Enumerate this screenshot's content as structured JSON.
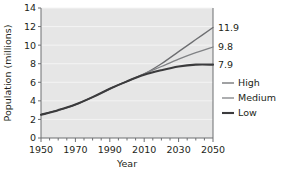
{
  "chart_data": {
    "type": "line",
    "title": "",
    "xlabel": "Year",
    "ylabel": "Population (millions)",
    "xlim": [
      1950,
      2050
    ],
    "ylim": [
      0,
      14
    ],
    "grid": true,
    "grid_orientation": "horizontal",
    "plot_background": "#e6e6e6",
    "figure_background": "#ffffff",
    "legend_position": "right",
    "x_major_ticks": [
      1950,
      1970,
      1990,
      2010,
      2030,
      2050
    ],
    "x_major_tick_labels": [
      "1950",
      "1970",
      "1990",
      "2010",
      "2030",
      "2050"
    ],
    "x_minor_tick_step": 5,
    "y_ticks": [
      0,
      2,
      4,
      6,
      8,
      10,
      12,
      14
    ],
    "y_tick_labels": [
      "0",
      "2",
      "4",
      "6",
      "8",
      "10",
      "12",
      "14"
    ],
    "x": [
      1950,
      1960,
      1970,
      1980,
      1990,
      2000,
      2010,
      2020,
      2030,
      2040,
      2050
    ],
    "series": [
      {
        "name": "High",
        "color": "#6d6e71",
        "width": 1.3,
        "end_label": "11.9",
        "end_value": 11.9,
        "values": [
          2.5,
          3.0,
          3.6,
          4.4,
          5.3,
          6.1,
          6.9,
          8.0,
          9.3,
          10.6,
          11.9
        ]
      },
      {
        "name": "Medium",
        "color": "#808285",
        "width": 1.3,
        "end_label": "9.8",
        "end_value": 9.8,
        "values": [
          2.5,
          3.0,
          3.6,
          4.4,
          5.3,
          6.1,
          6.9,
          7.7,
          8.5,
          9.2,
          9.8
        ]
      },
      {
        "name": "Low",
        "color": "#3b3b3d",
        "width": 2.1,
        "end_label": "7.9",
        "end_value": 7.9,
        "values": [
          2.5,
          3.0,
          3.6,
          4.4,
          5.3,
          6.1,
          6.8,
          7.3,
          7.7,
          7.9,
          7.9
        ]
      }
    ],
    "legend": [
      {
        "label": "High",
        "color": "#6d6e71",
        "width": 1.3
      },
      {
        "label": "Medium",
        "color": "#808285",
        "width": 1.3
      },
      {
        "label": "Low",
        "color": "#3b3b3d",
        "width": 2.1
      }
    ],
    "annotations": [
      {
        "text": "11.9",
        "series": "High"
      },
      {
        "text": "9.8",
        "series": "Medium"
      },
      {
        "text": "7.9",
        "series": "Low"
      }
    ]
  }
}
